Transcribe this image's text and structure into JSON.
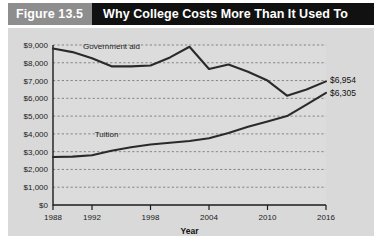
{
  "figure": {
    "number_label": "Figure 13.5",
    "title": "Why College Costs More Than It Used To"
  },
  "chart_data": {
    "type": "line",
    "title": "Why College Costs More Than It Used To",
    "xlabel": "Year",
    "ylabel": "",
    "xlim": [
      1988,
      2016
    ],
    "ylim": [
      0,
      9000
    ],
    "grid": true,
    "legend_position": "inline-annotation",
    "x_tick_labels": [
      "1988",
      "1992",
      "1998",
      "2004",
      "2010",
      "2016"
    ],
    "x_ticks": [
      1988,
      1992,
      1998,
      2004,
      2010,
      2016
    ],
    "y_tick_labels": [
      "$0",
      "$1,000",
      "$2,000",
      "$3,000",
      "$4,000",
      "$5,000",
      "$6,000",
      "$7,000",
      "$8,000",
      "$9,000"
    ],
    "y_ticks": [
      0,
      1000,
      2000,
      3000,
      4000,
      5000,
      6000,
      7000,
      8000,
      9000
    ],
    "series": [
      {
        "name": "Government aid",
        "label": "Government aid",
        "end_value_label": "$6,954",
        "x": [
          1988,
          1990,
          1992,
          1994,
          1996,
          1998,
          2000,
          2002,
          2004,
          2006,
          2008,
          2010,
          2012,
          2014,
          2016
        ],
        "values": [
          8800,
          8600,
          8250,
          7800,
          7800,
          7850,
          8300,
          8900,
          7650,
          7900,
          7500,
          7000,
          6150,
          6500,
          6954
        ]
      },
      {
        "name": "Tuition",
        "label": "Tuition",
        "end_value_label": "$6,305",
        "x": [
          1988,
          1990,
          1992,
          1994,
          1996,
          1998,
          2000,
          2002,
          2004,
          2006,
          2008,
          2010,
          2012,
          2014,
          2016
        ],
        "values": [
          2700,
          2720,
          2800,
          3050,
          3250,
          3400,
          3500,
          3600,
          3750,
          4050,
          4400,
          4700,
          5000,
          5650,
          6305
        ]
      }
    ],
    "annotations": [
      {
        "text": "Government aid",
        "x": 1994,
        "y": 8600
      },
      {
        "text": "Tuition",
        "x": 1993,
        "y": 3500
      },
      {
        "text": "$6,954",
        "x": 2016,
        "y": 6954
      },
      {
        "text": "$6,305",
        "x": 2016,
        "y": 6305
      }
    ]
  },
  "colors": {
    "header_block": "#8e8e8e",
    "header_bar": "#111111",
    "panel_bg": "#d9d9d9",
    "plot_bg": "#dcdcdc",
    "line": "#2a2a2a",
    "grid": "#6e6e6e"
  }
}
